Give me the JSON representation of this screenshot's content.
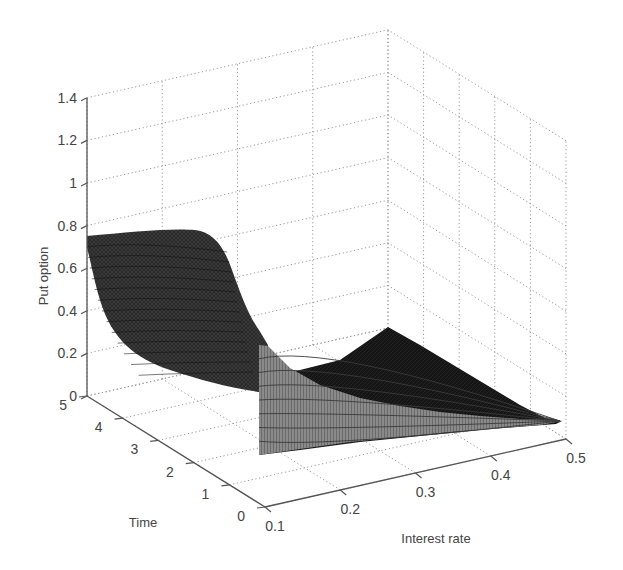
{
  "chart_data": {
    "type": "surface",
    "title": "",
    "xlabel": "Interest rate",
    "ylabel": "Time",
    "zlabel": "Put option",
    "x_ticks": [
      "0.1",
      "0.2",
      "0.3",
      "0.4",
      "0.5"
    ],
    "y_ticks": [
      "0",
      "1",
      "2",
      "3",
      "4",
      "5"
    ],
    "z_ticks": [
      "0",
      "0.2",
      "0.4",
      "0.6",
      "0.8",
      "1",
      "1.2",
      "1.4"
    ],
    "xlim": [
      0.1,
      0.5
    ],
    "ylim": [
      0,
      5
    ],
    "zlim": [
      0,
      1.4
    ],
    "grid": true,
    "colormap": "gray",
    "sample_values": [
      {
        "rate": 0.1,
        "time": 5,
        "value": 0.75
      },
      {
        "rate": 0.1,
        "time": 4,
        "value": 0.74
      },
      {
        "rate": 0.1,
        "time": 3,
        "value": 0.55
      },
      {
        "rate": 0.1,
        "time": 2,
        "value": 0.25
      },
      {
        "rate": 0.1,
        "time": 1,
        "value": 0.12
      },
      {
        "rate": 0.15,
        "time": 5,
        "value": 0.77
      },
      {
        "rate": 0.2,
        "time": 5,
        "value": 0.3
      },
      {
        "rate": 0.25,
        "time": 5,
        "value": 0.02
      },
      {
        "rate": 0.5,
        "time": 5,
        "value": 0.0
      },
      {
        "rate": 0.2,
        "time": 0.3,
        "value": 0.45
      },
      {
        "rate": 0.3,
        "time": 0.3,
        "value": 0.25
      },
      {
        "rate": 0.4,
        "time": 0.3,
        "value": 0.1
      },
      {
        "rate": 0.5,
        "time": 0.3,
        "value": 0.02
      }
    ]
  }
}
